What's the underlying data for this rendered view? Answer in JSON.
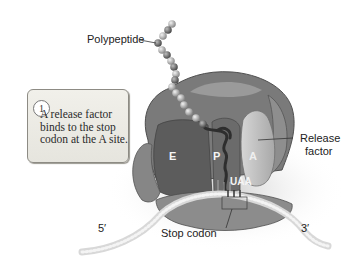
{
  "diagram": {
    "type": "biology-illustration",
    "labels": {
      "polypeptide": "Polypeptide",
      "release_factor": "Release\nfactor",
      "release_factor_line1": "Release",
      "release_factor_line2": "factor",
      "stop_codon": "Stop codon",
      "five_prime": "5′",
      "three_prime": "3′"
    },
    "sites": {
      "e": "E",
      "p": "P",
      "a": "A"
    },
    "codon": "UAA",
    "callout": {
      "step_number": "1",
      "text": "A release factor binds to the stop codon at the A site."
    },
    "colors": {
      "ribosome_dark": "#6a6a6a",
      "ribosome_mid": "#858585",
      "ribosome_light": "#9c9c9c",
      "release_factor": "#bdbdbd",
      "mrna": "#d9d9d9",
      "callout_bg": "#ebeae3"
    }
  }
}
